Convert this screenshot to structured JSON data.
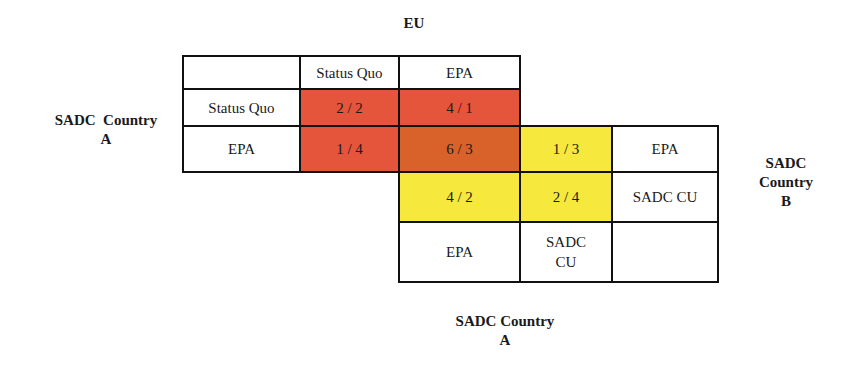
{
  "labels": {
    "top": "EU",
    "left": [
      "SADC  Country",
      "A"
    ],
    "right": [
      "SADC",
      "Country",
      "B"
    ],
    "bottom": [
      "SADC Country",
      "A"
    ]
  },
  "top_matrix": {
    "column_headers": [
      "",
      "Status Quo",
      "EPA"
    ],
    "row_headers": [
      "Status Quo",
      "EPA"
    ],
    "cells": [
      [
        "2 / 2",
        "4 / 1"
      ],
      [
        "1 / 4",
        "6 / 3"
      ]
    ]
  },
  "bottom_matrix": {
    "row_headers": [
      "EPA",
      "SADC CU"
    ],
    "column_headers": [
      "EPA",
      "SADC CU"
    ],
    "column_header_lines": [
      [
        "EPA"
      ],
      [
        "SADC",
        "CU"
      ]
    ],
    "cells": [
      [
        "6 / 3",
        "1 / 3"
      ],
      [
        "4 / 2",
        "2 / 4"
      ]
    ]
  },
  "colors": {
    "red": "#e4553b",
    "dark_orange": "#d8622a",
    "yellow": "#f6e83c"
  }
}
